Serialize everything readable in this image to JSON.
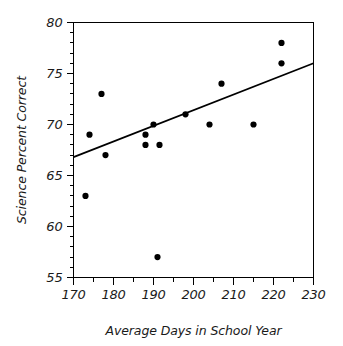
{
  "chart_data": {
    "type": "scatter",
    "title": "",
    "xlabel": "Average Days in School Year",
    "ylabel": "Science Percent Correct",
    "xlim": [
      170,
      230
    ],
    "ylim": [
      55,
      80
    ],
    "x_major_ticks": [
      170,
      180,
      190,
      200,
      210,
      220,
      230
    ],
    "x_major_tick_labels": [
      "170",
      "180",
      "190",
      "200",
      "210",
      "220",
      "230"
    ],
    "x_minor_tick_step": 5,
    "y_major_ticks": [
      55,
      60,
      65,
      70,
      75,
      80
    ],
    "y_major_tick_labels": [
      "55",
      "60",
      "65",
      "70",
      "75",
      "80"
    ],
    "y_minor_tick_step": 1,
    "grid": false,
    "legend": false,
    "marker": "filled-circle",
    "marker_color": "#000000",
    "points": [
      {
        "x": 173,
        "y": 63
      },
      {
        "x": 174,
        "y": 69
      },
      {
        "x": 177,
        "y": 73
      },
      {
        "x": 178,
        "y": 67
      },
      {
        "x": 188,
        "y": 69
      },
      {
        "x": 188,
        "y": 68
      },
      {
        "x": 190,
        "y": 70
      },
      {
        "x": 191,
        "y": 57
      },
      {
        "x": 191.5,
        "y": 68
      },
      {
        "x": 198,
        "y": 71
      },
      {
        "x": 204,
        "y": 70
      },
      {
        "x": 207,
        "y": 74
      },
      {
        "x": 215,
        "y": 70
      },
      {
        "x": 222,
        "y": 78
      },
      {
        "x": 222,
        "y": 76
      }
    ],
    "trend_line": {
      "label": "trend line",
      "color": "#000000",
      "x_start": 170,
      "y_start": 66.8,
      "x_end": 230,
      "y_end": 76.0
    }
  },
  "figure": {
    "background_color": "#ffffff",
    "axis_color": "#000000"
  }
}
